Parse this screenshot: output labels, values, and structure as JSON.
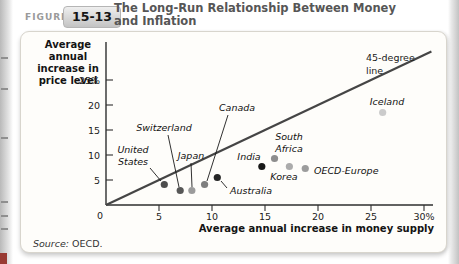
{
  "header": {
    "figure_label": "FIGURE",
    "figure_number": "15-13",
    "title": "The Long-Run Relationship Between Money and Inflation"
  },
  "source": {
    "prefix": "Source:",
    "text": "OECD."
  },
  "chart_data": {
    "type": "scatter",
    "title": "The Long-Run Relationship Between Money and Inflation",
    "xlabel": "Average annual increase in money supply",
    "ylabel": "Average annual increase in price level",
    "xlim": [
      0,
      30
    ],
    "ylim": [
      0,
      25
    ],
    "grid": false,
    "x_ticks": [
      5,
      10,
      15,
      20,
      25,
      30
    ],
    "x_tick_labels": [
      "5",
      "10",
      "15",
      "20",
      "25",
      "30%"
    ],
    "y_ticks": [
      5,
      10,
      15,
      20,
      25
    ],
    "y_tick_labels": [
      "5",
      "10",
      "15",
      "20",
      "25%"
    ],
    "origin_label": "0",
    "reference_line": {
      "label": "45-degree line",
      "x": [
        0,
        30.7
      ],
      "y": [
        0,
        30.7
      ],
      "color": "#454545"
    },
    "points": [
      {
        "name": "United States",
        "x": 5.5,
        "y": 4.1,
        "color": "#4d4d4d"
      },
      {
        "name": "Switzerland",
        "x": 7.0,
        "y": 2.9,
        "color": "#575757"
      },
      {
        "name": "Japan",
        "x": 8.1,
        "y": 2.9,
        "color": "#9b9b9b"
      },
      {
        "name": "Canada",
        "x": 9.3,
        "y": 4.1,
        "color": "#7e7e7e"
      },
      {
        "name": "Australia",
        "x": 10.5,
        "y": 5.5,
        "color": "#262626"
      },
      {
        "name": "India",
        "x": 14.7,
        "y": 7.7,
        "color": "#181818"
      },
      {
        "name": "South Africa",
        "x": 15.9,
        "y": 9.3,
        "color": "#8d8d8d"
      },
      {
        "name": "Korea",
        "x": 17.3,
        "y": 7.7,
        "color": "#ababab"
      },
      {
        "name": "OECD-Europe",
        "x": 18.8,
        "y": 7.3,
        "color": "#9c9c9c"
      },
      {
        "name": "Iceland",
        "x": 26.1,
        "y": 18.5,
        "color": "#cbcbcb"
      }
    ]
  }
}
